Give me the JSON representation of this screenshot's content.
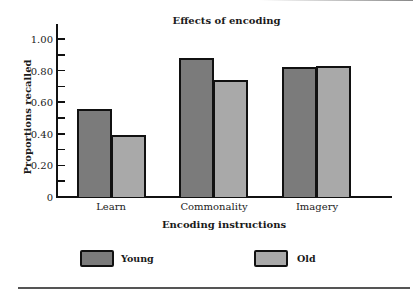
{
  "chart_data": {
    "type": "bar",
    "title": "Effects of encoding",
    "xlabel": "Encoding instructions",
    "ylabel": "Proportions recalled",
    "categories": [
      "Learn",
      "Commonality",
      "Imagery"
    ],
    "series": [
      {
        "name": "Young",
        "values": [
          0.56,
          0.88,
          0.82
        ],
        "color": "#7b7b7b"
      },
      {
        "name": "Old",
        "values": [
          0.39,
          0.74,
          0.83
        ],
        "color": "#a9a9a9"
      }
    ],
    "ylim": [
      0,
      1.1
    ],
    "yticks": [
      "0",
      "0.20",
      "0.40",
      "0.60",
      "0.80",
      "1.00"
    ],
    "grid": false,
    "legend_position": "bottom"
  },
  "legend": {
    "young_label": "Young",
    "old_label": "Old"
  }
}
